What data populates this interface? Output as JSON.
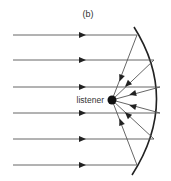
{
  "figure": {
    "panel_label": "(b)",
    "listener_label": "listener",
    "line_color": "#555555",
    "reflector_color": "#222222",
    "listener_point": [
      112,
      100
    ],
    "incident_rays": [
      {
        "y": 35,
        "x_start": 13,
        "x_end": 137
      },
      {
        "y": 60,
        "x_start": 13,
        "x_end": 154
      },
      {
        "y": 87,
        "x_start": 13,
        "x_end": 160
      },
      {
        "y": 113,
        "x_start": 13,
        "x_end": 160
      },
      {
        "y": 139,
        "x_start": 13,
        "x_end": 154
      },
      {
        "y": 165,
        "x_start": 13,
        "x_end": 137
      }
    ]
  }
}
